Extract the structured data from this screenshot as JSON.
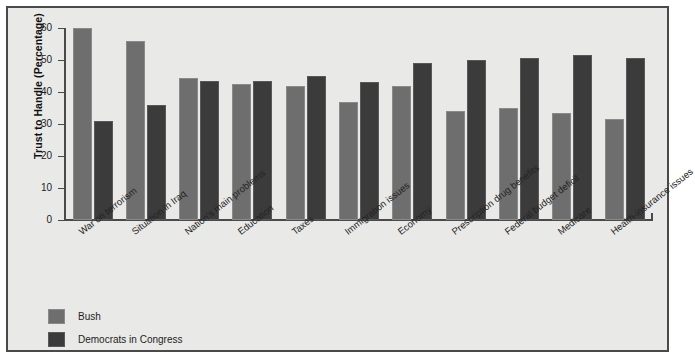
{
  "chart_data": {
    "type": "bar",
    "title": "",
    "xlabel": "",
    "ylabel": "Trust to Handle (Percentage)",
    "ylim": [
      0,
      60
    ],
    "yticks": [
      0,
      10,
      20,
      30,
      40,
      50,
      60
    ],
    "grid": false,
    "legend_position": "bottom-left",
    "categories": [
      "War on terrorism",
      "Situation in Iraq",
      "Nation's main problems",
      "Education",
      "Taxes",
      "Immigration issues",
      "Economy",
      "Prescription drug benefits",
      "Federal budget deficit",
      "Medicare",
      "Health-insurance issues"
    ],
    "series": [
      {
        "name": "Bush",
        "color": "#6e6e6e",
        "values": [
          60,
          56,
          44.5,
          42.5,
          42,
          37,
          42,
          34,
          35,
          33.5,
          31.5
        ]
      },
      {
        "name": "Democrats in Congress",
        "color": "#3b3b3b",
        "values": [
          31,
          36,
          43.5,
          43.5,
          45,
          43,
          49,
          50,
          50.5,
          51.5,
          50.5
        ]
      }
    ]
  },
  "legend": {
    "items": [
      {
        "label": "Bush",
        "swatch": "bush"
      },
      {
        "label": "Democrats in Congress",
        "swatch": "dem"
      }
    ]
  },
  "caption": {
    "text": ""
  }
}
